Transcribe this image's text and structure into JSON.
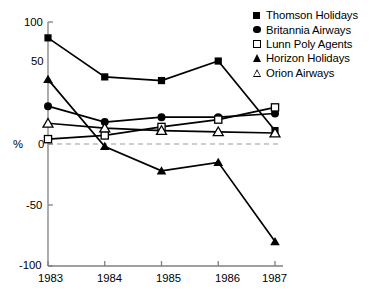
{
  "chart_data": {
    "type": "line",
    "title": "",
    "xlabel": "",
    "ylabel": "%",
    "categories": [
      "1983",
      "1984",
      "1985",
      "1986",
      "1987"
    ],
    "x": [
      1983,
      1984,
      1985,
      1986,
      1987
    ],
    "ylim": [
      -100,
      100
    ],
    "yticks": [
      -100,
      -50,
      0,
      50,
      100
    ],
    "ytick_labels": [
      "-100",
      "-50",
      "0",
      "50",
      "100"
    ],
    "xtick_labels": [
      "1983",
      "1984",
      "1985",
      "1986",
      "1987"
    ],
    "grid": false,
    "zero_reference_line": true,
    "zero_reference_value": 0,
    "legend_position": "top-right",
    "series": [
      {
        "name": "Thomson Holidays",
        "marker": "filled-square",
        "values": [
          87,
          55,
          52,
          68,
          11
        ]
      },
      {
        "name": "Britannia Airways",
        "marker": "filled-circle",
        "values": [
          31,
          18,
          22,
          22,
          25
        ]
      },
      {
        "name": "Lunn Poly Agents",
        "marker": "open-square",
        "values": [
          4,
          7,
          14,
          20,
          30
        ]
      },
      {
        "name": "Horizon Holidays",
        "marker": "filled-triangle",
        "values": [
          53,
          -2,
          -22,
          -15,
          -80
        ]
      },
      {
        "name": "Orion Airways",
        "marker": "open-triangle",
        "values": [
          17,
          13,
          11,
          10,
          9
        ]
      }
    ]
  },
  "axes": {
    "y_label": "%",
    "y_ticks": [
      "100",
      "50",
      "0",
      "-50",
      "-100"
    ],
    "x_ticks": [
      "1983",
      "1984",
      "1985",
      "1986",
      "1987"
    ]
  },
  "legend": {
    "items": [
      {
        "label": "Thomson Holidays",
        "icon": "filled-square-icon"
      },
      {
        "label": "Britannia Airways",
        "icon": "filled-circle-icon"
      },
      {
        "label": "Lunn Poly Agents",
        "icon": "open-square-icon"
      },
      {
        "label": "Horizon Holidays",
        "icon": "filled-triangle-icon"
      },
      {
        "label": "Orion Airways",
        "icon": "open-triangle-icon"
      }
    ]
  },
  "colors": {
    "ink": "#000000",
    "axis": "#808080",
    "background": "#ffffff"
  }
}
